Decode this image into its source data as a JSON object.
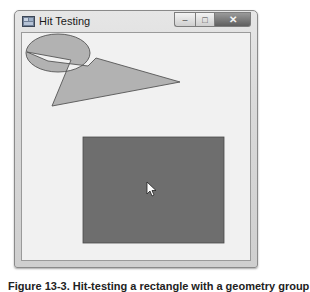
{
  "window": {
    "title": "Hit Testing",
    "icon": "app-window-icon",
    "controls": {
      "minimize_icon": "minimize-icon",
      "maximize_icon": "maximize-icon",
      "close_icon": "close-icon",
      "minimize_glyph": "–",
      "maximize_glyph": "□",
      "close_glyph": "✕"
    }
  },
  "canvas": {
    "shapes": [
      {
        "type": "ellipse+polygon-geometry-group",
        "fill_rule": "evenodd",
        "fill": "#b2b2b2",
        "stroke": "#555555"
      },
      {
        "type": "rectangle",
        "fill": "#6e6e6e",
        "stroke": "#4a4a4a",
        "hit": true
      }
    ],
    "cursor": {
      "icon": "mouse-pointer-icon",
      "x": 147,
      "y": 182
    }
  },
  "caption": {
    "text": "Figure 13-3. Hit-testing a rectangle with a geometry group"
  },
  "colors": {
    "client_background": "#f1f1f1",
    "shape_fill": "#b2b2b2",
    "rect_fill": "#6e6e6e",
    "stroke": "#555555"
  }
}
